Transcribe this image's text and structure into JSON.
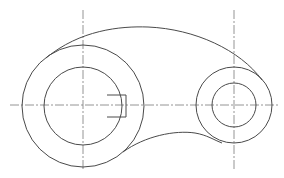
{
  "drawing": {
    "type": "mechanical-part-2d",
    "description": "Link/lever plate with two bosses and a keyway",
    "colors": {
      "background": "#ffffff",
      "outline": "#4a4a4a",
      "centerline": "#7a7a7a"
    },
    "left_boss": {
      "cx": 83,
      "cy": 106,
      "outer_r": 61,
      "inner_r": 39,
      "keyway": {
        "x1": 107,
        "x2": 126,
        "y_top": 95,
        "y_bottom": 117
      }
    },
    "right_boss": {
      "cx": 234,
      "cy": 105,
      "outer_r": 38,
      "inner_r": 22
    },
    "centerlines": {
      "horizontal": {
        "y": 105,
        "x1": 10,
        "x2": 280
      },
      "vertical_left": {
        "x": 83,
        "y1": 10,
        "y2": 170
      },
      "vertical_right": {
        "x": 234,
        "y1": 10,
        "y2": 170
      }
    }
  }
}
